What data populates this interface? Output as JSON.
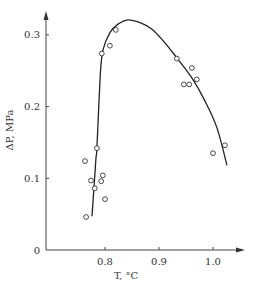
{
  "chart_data": {
    "type": "scatter",
    "title": "",
    "xlabel": "T, °C",
    "ylabel": "ΔP, MPa",
    "xlim": [
      0.7,
      1.06
    ],
    "ylim": [
      0,
      0.33
    ],
    "grid": false,
    "legend": null,
    "x_ticks": [
      {
        "value": 0.8,
        "label": "0.8"
      },
      {
        "value": 0.9,
        "label": "0.9"
      },
      {
        "value": 1.0,
        "label": "1.0"
      }
    ],
    "y_ticks": [
      {
        "value": 0,
        "label": "0"
      },
      {
        "value": 0.1,
        "label": "0.1"
      },
      {
        "value": 0.2,
        "label": "0.2"
      },
      {
        "value": 0.3,
        "label": "0.3"
      }
    ],
    "series": [
      {
        "name": "measured",
        "style": "open-circle",
        "points": [
          {
            "x": 0.765,
            "y": 0.046
          },
          {
            "x": 0.8,
            "y": 0.071
          },
          {
            "x": 0.781,
            "y": 0.086
          },
          {
            "x": 0.793,
            "y": 0.096
          },
          {
            "x": 0.774,
            "y": 0.097
          },
          {
            "x": 0.796,
            "y": 0.104
          },
          {
            "x": 0.763,
            "y": 0.124
          },
          {
            "x": 0.785,
            "y": 0.142
          },
          {
            "x": 0.794,
            "y": 0.274
          },
          {
            "x": 0.809,
            "y": 0.285
          },
          {
            "x": 0.82,
            "y": 0.307
          },
          {
            "x": 0.933,
            "y": 0.267
          },
          {
            "x": 0.961,
            "y": 0.254
          },
          {
            "x": 0.97,
            "y": 0.238
          },
          {
            "x": 0.946,
            "y": 0.231
          },
          {
            "x": 0.956,
            "y": 0.231
          },
          {
            "x": 1.0,
            "y": 0.135
          },
          {
            "x": 1.022,
            "y": 0.146
          }
        ]
      },
      {
        "name": "fitted curve",
        "style": "line",
        "points": [
          {
            "x": 0.776,
            "y": 0.047
          },
          {
            "x": 0.783,
            "y": 0.125
          },
          {
            "x": 0.785,
            "y": 0.142
          },
          {
            "x": 0.791,
            "y": 0.24
          },
          {
            "x": 0.796,
            "y": 0.278
          },
          {
            "x": 0.809,
            "y": 0.303
          },
          {
            "x": 0.824,
            "y": 0.315
          },
          {
            "x": 0.843,
            "y": 0.321
          },
          {
            "x": 0.865,
            "y": 0.317
          },
          {
            "x": 0.887,
            "y": 0.308
          },
          {
            "x": 0.911,
            "y": 0.289
          },
          {
            "x": 0.933,
            "y": 0.268
          },
          {
            "x": 0.961,
            "y": 0.24
          },
          {
            "x": 0.985,
            "y": 0.208
          },
          {
            "x": 1.007,
            "y": 0.171
          },
          {
            "x": 1.026,
            "y": 0.118
          }
        ]
      }
    ]
  },
  "plot_frame": {
    "origin_px": [
      46,
      250
    ],
    "x_px_per_unit": 540,
    "x_ref_value": 0.8,
    "x_ref_px": 105,
    "y_px_per_unit": 717,
    "x_axis_end_px": 245,
    "y_axis_end_px": 11
  }
}
